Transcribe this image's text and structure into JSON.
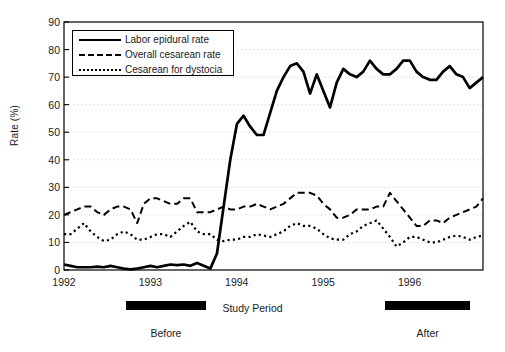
{
  "chart_data": {
    "type": "line",
    "title": "",
    "xlabel": "Study Period",
    "ylabel": "Rate (%)",
    "ylim": [
      0,
      90
    ],
    "ytick_step": 10,
    "yticks": [
      90,
      80,
      70,
      60,
      50,
      40,
      30,
      20,
      10,
      0
    ],
    "xticks": [
      "1992",
      "1993",
      "1994",
      "1995",
      "1996"
    ],
    "xlim": [
      1992.0,
      1996.85
    ],
    "grid": "horizontal dotted gridlines at every 10 units",
    "legend_position": "upper left inside plot",
    "line_color": "#000000",
    "series": [
      {
        "name": "Labor epidural rate",
        "style": "solid",
        "values": [
          2,
          1.5,
          1,
          1,
          1,
          1.2,
          1,
          1.5,
          1,
          0.5,
          0.2,
          0.5,
          1,
          1.5,
          1,
          1.5,
          2,
          1.8,
          2,
          1.5,
          2.5,
          1.5,
          0.5,
          6,
          23,
          40,
          53,
          56,
          52,
          49,
          49,
          57,
          65,
          70,
          74,
          75,
          72,
          64,
          71,
          65,
          59,
          68,
          73,
          71,
          70,
          72,
          76,
          73,
          71,
          71,
          73,
          76,
          76,
          72,
          70,
          69,
          69,
          72,
          74,
          71,
          70,
          66,
          68,
          70
        ]
      },
      {
        "name": "Overall cesarean rate",
        "style": "dashed",
        "values": [
          20,
          21,
          22,
          23,
          23,
          21,
          20,
          22,
          23,
          23,
          22,
          17,
          24,
          26,
          26,
          25,
          24,
          24,
          26,
          26,
          21,
          21,
          21,
          22,
          23,
          22,
          22,
          23,
          23,
          24,
          23,
          22,
          23,
          24,
          26,
          28,
          28,
          28,
          27,
          24,
          22,
          19,
          19,
          20,
          22,
          22,
          22,
          23,
          23,
          28,
          25,
          22,
          19,
          16,
          16,
          18,
          18,
          17,
          19,
          20,
          21,
          22,
          23,
          26
        ]
      },
      {
        "name": "Cesarean for dystocia",
        "style": "dotted",
        "values": [
          13,
          13,
          15,
          17,
          14,
          12,
          10.5,
          11,
          13,
          14,
          13,
          11,
          11,
          12,
          13,
          13,
          12,
          14,
          16,
          17.5,
          14,
          13,
          13,
          11,
          10.5,
          11,
          11,
          12,
          12,
          13,
          12.5,
          12,
          13,
          14,
          16,
          17,
          16,
          16,
          15,
          13,
          11.5,
          11,
          11,
          13,
          14,
          16,
          17,
          18,
          15,
          12,
          8.5,
          10,
          12,
          12,
          11,
          10,
          10,
          11,
          12,
          12.5,
          12,
          11,
          12,
          12.5
        ]
      }
    ],
    "annotations": [
      {
        "label": "Before",
        "type": "period-bar",
        "start": 1992.72,
        "end": 1993.64
      },
      {
        "label": "After",
        "type": "period-bar",
        "start": 1995.72,
        "end": 1996.7
      }
    ]
  }
}
